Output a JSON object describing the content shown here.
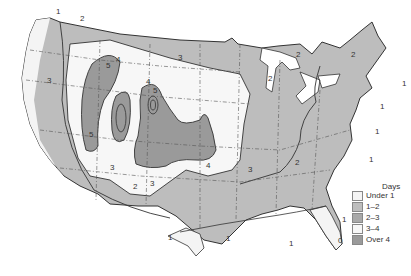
{
  "map": {
    "subject": "United States contour map of days",
    "colors": {
      "land_outline": "#333333",
      "state_border": "#555555",
      "background": "#ffffff"
    },
    "contour_labels": [
      {
        "value": "1",
        "x": 56,
        "y": 14
      },
      {
        "value": "2",
        "x": 80,
        "y": 21
      },
      {
        "value": "3",
        "x": 47,
        "y": 83
      },
      {
        "value": "5",
        "x": 106,
        "y": 68
      },
      {
        "value": "4",
        "x": 116,
        "y": 62
      },
      {
        "value": "3",
        "x": 178,
        "y": 60
      },
      {
        "value": "5",
        "x": 89,
        "y": 137
      },
      {
        "value": "4",
        "x": 146,
        "y": 84
      },
      {
        "value": "5",
        "x": 153,
        "y": 93
      },
      {
        "value": "3",
        "x": 110,
        "y": 170
      },
      {
        "value": "3",
        "x": 150,
        "y": 186
      },
      {
        "value": "2",
        "x": 133,
        "y": 189
      },
      {
        "value": "4",
        "x": 206,
        "y": 168
      },
      {
        "value": "3",
        "x": 248,
        "y": 172
      },
      {
        "value": "2",
        "x": 295,
        "y": 165
      },
      {
        "value": "2",
        "x": 296,
        "y": 57
      },
      {
        "value": "2",
        "x": 351,
        "y": 57
      },
      {
        "value": "2",
        "x": 268,
        "y": 81
      },
      {
        "value": "1",
        "x": 402,
        "y": 86
      },
      {
        "value": "1",
        "x": 380,
        "y": 109
      },
      {
        "value": "1",
        "x": 375,
        "y": 134
      },
      {
        "value": "1",
        "x": 289,
        "y": 246
      },
      {
        "value": "1",
        "x": 168,
        "y": 240
      },
      {
        "value": "1",
        "x": 226,
        "y": 241
      },
      {
        "value": "1",
        "x": 342,
        "y": 222
      },
      {
        "value": "1",
        "x": 369,
        "y": 162
      },
      {
        "value": "0",
        "x": 338,
        "y": 243
      }
    ]
  },
  "legend": {
    "title": "Days",
    "items": [
      {
        "label": "Under 1",
        "color": "#f4f4f4"
      },
      {
        "label": "1–2",
        "color": "#bdbdbd"
      },
      {
        "label": "2–3",
        "color": "#a9a9a9"
      },
      {
        "label": "3–4",
        "color": "#f7f7f7"
      },
      {
        "label": "Over 4",
        "color": "#9a9a9a"
      }
    ]
  }
}
